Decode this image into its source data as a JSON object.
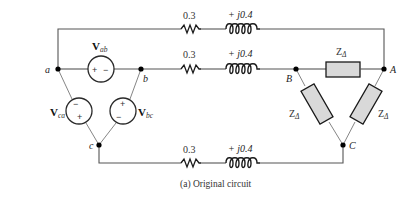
{
  "figure": {
    "caption": "(a) Original circuit"
  },
  "lines": {
    "top": {
      "resistance": "0.3",
      "reactance": "+ j0.4"
    },
    "middle": {
      "resistance": "0.3",
      "reactance": "+ j0.4"
    },
    "bottom": {
      "resistance": "0.3",
      "reactance": "+ j0.4"
    }
  },
  "source_nodes": {
    "a": "a",
    "b": "b",
    "c": "c"
  },
  "load_nodes": {
    "A": "A",
    "B": "B",
    "C": "C"
  },
  "sources": {
    "ab": {
      "main": "V",
      "sub": "ab",
      "sign_left": "+",
      "sign_right": "−"
    },
    "ca": {
      "main": "V",
      "sub": "ca",
      "sign_top": "−",
      "sign_bottom": "+"
    },
    "bc": {
      "main": "V",
      "sub": "bc",
      "sign_top": "+",
      "sign_bottom": "−"
    }
  },
  "loads": {
    "BA": {
      "main": "Z",
      "sub": "Δ"
    },
    "BC": {
      "main": "Z",
      "sub": "Δ"
    },
    "AC": {
      "main": "Z",
      "sub": "Δ"
    }
  },
  "colors": {
    "wire": "#555555",
    "component": "#1a1a1a",
    "impedance_fill": "#d9d9d9",
    "background": "#ffffff"
  }
}
